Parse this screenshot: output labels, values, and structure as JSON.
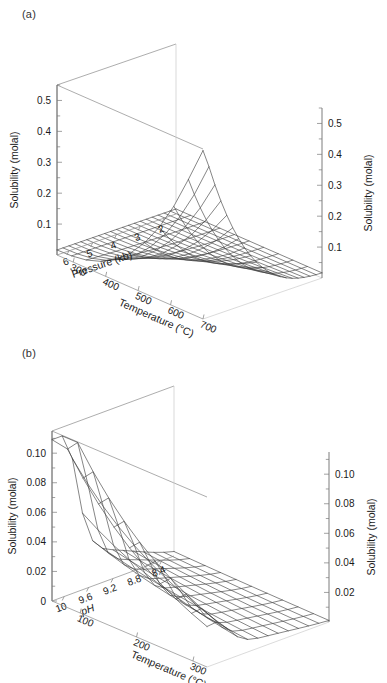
{
  "figure": {
    "panels": [
      {
        "id": "a",
        "label": "(a)",
        "chart_ref": 0
      },
      {
        "id": "b",
        "label": "(b)",
        "chart_ref": 1
      }
    ]
  },
  "chart_data": [
    {
      "type": "surface",
      "panel": "(a)",
      "title": "",
      "xlabel": "Pressure (kb)",
      "ylabel": "Temperature (°C)",
      "zlabel": "Solubility (molal)",
      "zlabel_right": "Solubility (molal)",
      "x_name": "Pressure",
      "x_units": "kb",
      "x_ticks": [
        6,
        5,
        4,
        3,
        2
      ],
      "x_tick_labels": [
        "6",
        "5",
        "4",
        "3",
        "2"
      ],
      "xlim": [
        6.5,
        1.5
      ],
      "y_name": "Temperature",
      "y_units": "°C",
      "y_ticks": [
        300,
        400,
        500,
        600,
        700
      ],
      "y_tick_labels": [
        "300",
        "400",
        "500",
        "600",
        "700"
      ],
      "ylim": [
        250,
        700
      ],
      "z_ticks": [
        0.1,
        0.2,
        0.3,
        0.4,
        0.5
      ],
      "z_tick_labels": [
        "0.1",
        "0.2",
        "0.3",
        "0.4",
        "0.5"
      ],
      "z_minor_ticks": [
        0.05,
        0.15,
        0.25,
        0.35,
        0.45,
        0.55
      ],
      "zlim": [
        0,
        0.55
      ],
      "grid": false,
      "legend": "none",
      "mesh_nx": 21,
      "mesh_ny": 11,
      "surface_note": "Solubility rises steeply toward high pressure and high temperature; peak near 6.5 kb / 700 C",
      "samples": {
        "pressure": [
          6.5,
          5.5,
          4.5,
          3.5,
          2.5,
          1.5
        ],
        "temperature": [
          250,
          350,
          450,
          550,
          650,
          700
        ],
        "solubility_grid": [
          [
            0.018,
            0.04,
            0.09,
            0.19,
            0.38,
            0.53
          ],
          [
            0.014,
            0.03,
            0.066,
            0.132,
            0.248,
            0.335
          ],
          [
            0.011,
            0.022,
            0.046,
            0.086,
            0.152,
            0.2
          ],
          [
            0.008,
            0.016,
            0.03,
            0.053,
            0.088,
            0.113
          ],
          [
            0.006,
            0.011,
            0.019,
            0.031,
            0.048,
            0.06
          ],
          [
            0.004,
            0.007,
            0.011,
            0.017,
            0.025,
            0.03
          ]
        ]
      }
    },
    {
      "type": "surface",
      "panel": "(b)",
      "title": "",
      "xlabel": "pH",
      "ylabel": "Temperature (°C)",
      "zlabel": "Solubility (molal)",
      "zlabel_right": "Solubility (molal)",
      "x_name": "pH",
      "x_units": "",
      "x_ticks": [
        10,
        9.6,
        9.2,
        8.8,
        8.4
      ],
      "x_tick_labels": [
        "10",
        "9.6",
        "9.2",
        "8.8",
        "8.4"
      ],
      "xlim": [
        10.2,
        8.2
      ],
      "y_name": "Temperature",
      "y_units": "°C",
      "y_ticks": [
        100,
        200,
        300
      ],
      "y_tick_labels": [
        "100",
        "200",
        "300"
      ],
      "ylim": [
        50,
        325
      ],
      "z_ticks": [
        0,
        0.02,
        0.04,
        0.06,
        0.08,
        0.1
      ],
      "z_tick_labels": [
        "0",
        "0.02",
        "0.04",
        "0.06",
        "0.08",
        "0.10"
      ],
      "z_tick_labels_right": [
        "0.02",
        "0.04",
        "0.06",
        "0.08",
        "0.10"
      ],
      "z_minor_ticks": [
        0.01,
        0.03,
        0.05,
        0.07,
        0.09,
        0.11
      ],
      "zlim": [
        0,
        0.115
      ],
      "grid": false,
      "legend": "none",
      "mesh_nx": 13,
      "mesh_ny": 11,
      "surface_note": "Sharp ridge peaking near pH 9.9 at low temperature, decaying toward low pH and high temperature",
      "samples": {
        "pH": [
          10.2,
          10.0,
          9.6,
          9.2,
          8.8,
          8.4
        ],
        "temperature": [
          50,
          100,
          150,
          200,
          250,
          300
        ],
        "solubility_grid": [
          [
            0.112,
            0.078,
            0.055,
            0.04,
            0.03,
            0.022
          ],
          [
            0.108,
            0.076,
            0.054,
            0.039,
            0.029,
            0.021
          ],
          [
            0.062,
            0.05,
            0.04,
            0.032,
            0.025,
            0.019
          ],
          [
            0.03,
            0.028,
            0.026,
            0.023,
            0.019,
            0.015
          ],
          [
            0.014,
            0.015,
            0.016,
            0.015,
            0.013,
            0.011
          ],
          [
            0.006,
            0.007,
            0.009,
            0.01,
            0.009,
            0.008
          ]
        ]
      }
    }
  ]
}
